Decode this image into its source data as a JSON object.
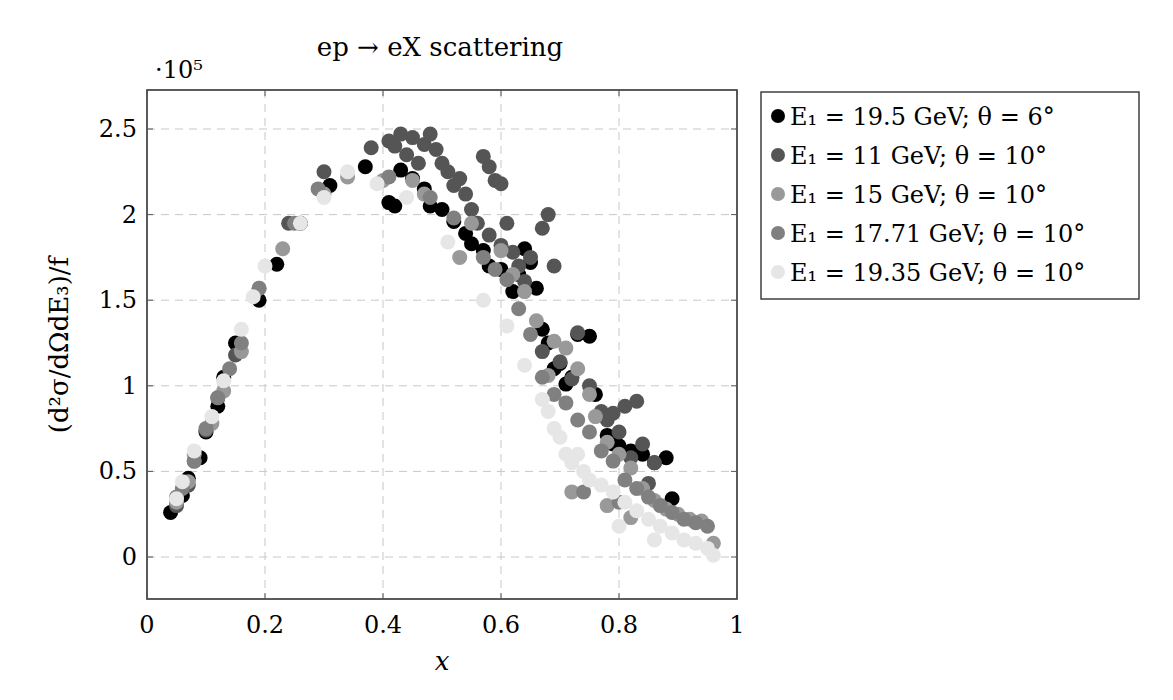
{
  "chart_data": {
    "type": "scatter",
    "title": "ep → eX scattering",
    "xlabel": "x",
    "ylabel": "(d²σ/dΩdE₃)/f",
    "y_scale_label": "·10⁵",
    "xlim": [
      0,
      1
    ],
    "ylim": [
      -0.25,
      2.72
    ],
    "x_ticks": [
      0,
      0.2,
      0.4,
      0.6,
      0.8,
      1
    ],
    "x_tick_labels": [
      "0",
      "0.2",
      "0.4",
      "0.6",
      "0.8",
      "1"
    ],
    "y_ticks": [
      0,
      0.5,
      1,
      1.5,
      2,
      2.5
    ],
    "y_tick_labels": [
      "0",
      "0.5",
      "1",
      "1.5",
      "2",
      "2.5"
    ],
    "grid": true,
    "legend_position": "outside right top",
    "series": [
      {
        "name": "E₁ = 19.5 GeV; θ = 6°",
        "color": "#000000",
        "points": [
          [
            0.04,
            0.26
          ],
          [
            0.06,
            0.36
          ],
          [
            0.07,
            0.46
          ],
          [
            0.09,
            0.58
          ],
          [
            0.1,
            0.73
          ],
          [
            0.12,
            0.88
          ],
          [
            0.13,
            1.05
          ],
          [
            0.15,
            1.25
          ],
          [
            0.19,
            1.5
          ],
          [
            0.22,
            1.71
          ],
          [
            0.26,
            1.95
          ],
          [
            0.31,
            2.17
          ],
          [
            0.37,
            2.28
          ],
          [
            0.41,
            2.07
          ],
          [
            0.42,
            2.05
          ],
          [
            0.43,
            2.26
          ],
          [
            0.45,
            2.21
          ],
          [
            0.47,
            2.15
          ],
          [
            0.48,
            2.05
          ],
          [
            0.5,
            2.03
          ],
          [
            0.52,
            1.96
          ],
          [
            0.54,
            1.89
          ],
          [
            0.55,
            1.83
          ],
          [
            0.57,
            1.79
          ],
          [
            0.58,
            1.7
          ],
          [
            0.6,
            1.68
          ],
          [
            0.62,
            1.55
          ],
          [
            0.63,
            1.65
          ],
          [
            0.64,
            1.8
          ],
          [
            0.65,
            1.72
          ],
          [
            0.66,
            1.57
          ],
          [
            0.67,
            1.33
          ],
          [
            0.68,
            1.25
          ],
          [
            0.69,
            1.1
          ],
          [
            0.7,
            1.13
          ],
          [
            0.71,
            1.01
          ],
          [
            0.72,
            1.05
          ],
          [
            0.73,
            1.3
          ],
          [
            0.75,
            1.29
          ],
          [
            0.76,
            0.95
          ],
          [
            0.78,
            0.71
          ],
          [
            0.79,
            0.66
          ],
          [
            0.8,
            0.65
          ],
          [
            0.82,
            0.62
          ],
          [
            0.84,
            0.6
          ],
          [
            0.86,
            0.55
          ],
          [
            0.88,
            0.58
          ],
          [
            0.89,
            0.34
          ]
        ]
      },
      {
        "name": "E₁ = 11 GeV; θ = 10°",
        "color": "#555555",
        "points": [
          [
            0.05,
            0.3
          ],
          [
            0.07,
            0.42
          ],
          [
            0.08,
            0.56
          ],
          [
            0.1,
            0.74
          ],
          [
            0.12,
            0.93
          ],
          [
            0.15,
            1.18
          ],
          [
            0.24,
            1.95
          ],
          [
            0.3,
            2.25
          ],
          [
            0.38,
            2.39
          ],
          [
            0.41,
            2.43
          ],
          [
            0.42,
            2.4
          ],
          [
            0.43,
            2.47
          ],
          [
            0.44,
            2.35
          ],
          [
            0.45,
            2.45
          ],
          [
            0.46,
            2.3
          ],
          [
            0.47,
            2.41
          ],
          [
            0.48,
            2.47
          ],
          [
            0.49,
            2.38
          ],
          [
            0.5,
            2.3
          ],
          [
            0.51,
            2.25
          ],
          [
            0.52,
            2.17
          ],
          [
            0.53,
            2.21
          ],
          [
            0.54,
            2.12
          ],
          [
            0.55,
            2.03
          ],
          [
            0.57,
            2.34
          ],
          [
            0.58,
            2.28
          ],
          [
            0.59,
            2.2
          ],
          [
            0.6,
            2.18
          ],
          [
            0.56,
            1.95
          ],
          [
            0.58,
            1.88
          ],
          [
            0.6,
            1.82
          ],
          [
            0.61,
            1.95
          ],
          [
            0.62,
            1.78
          ],
          [
            0.63,
            1.7
          ],
          [
            0.64,
            1.61
          ],
          [
            0.65,
            1.75
          ],
          [
            0.67,
            1.92
          ],
          [
            0.68,
            2.0
          ],
          [
            0.69,
            1.7
          ],
          [
            0.67,
            1.2
          ],
          [
            0.7,
            1.14
          ],
          [
            0.72,
            1.04
          ],
          [
            0.73,
            1.31
          ],
          [
            0.75,
            1.0
          ],
          [
            0.77,
            0.85
          ],
          [
            0.78,
            0.8
          ],
          [
            0.79,
            0.84
          ],
          [
            0.81,
            0.88
          ],
          [
            0.83,
            0.91
          ],
          [
            0.84,
            0.66
          ],
          [
            0.86,
            0.55
          ],
          [
            0.8,
            0.73
          ],
          [
            0.82,
            0.58
          ],
          [
            0.85,
            0.43
          ]
        ]
      },
      {
        "name": "E₁ = 15 GeV; θ = 10°",
        "color": "#999999",
        "points": [
          [
            0.05,
            0.32
          ],
          [
            0.07,
            0.44
          ],
          [
            0.08,
            0.6
          ],
          [
            0.11,
            0.78
          ],
          [
            0.13,
            0.97
          ],
          [
            0.16,
            1.2
          ],
          [
            0.19,
            1.57
          ],
          [
            0.23,
            1.8
          ],
          [
            0.3,
            2.12
          ],
          [
            0.34,
            2.22
          ],
          [
            0.4,
            2.2
          ],
          [
            0.45,
            2.2
          ],
          [
            0.47,
            2.12
          ],
          [
            0.53,
            1.75
          ],
          [
            0.55,
            1.95
          ],
          [
            0.6,
            1.79
          ],
          [
            0.62,
            1.65
          ],
          [
            0.64,
            1.55
          ],
          [
            0.66,
            1.38
          ],
          [
            0.68,
            1.06
          ],
          [
            0.69,
            1.26
          ],
          [
            0.71,
            1.22
          ],
          [
            0.73,
            1.1
          ],
          [
            0.75,
            0.95
          ],
          [
            0.76,
            0.82
          ],
          [
            0.78,
            0.67
          ],
          [
            0.8,
            0.6
          ],
          [
            0.82,
            0.52
          ],
          [
            0.84,
            0.4
          ],
          [
            0.86,
            0.33
          ],
          [
            0.88,
            0.28
          ],
          [
            0.9,
            0.25
          ],
          [
            0.92,
            0.22
          ],
          [
            0.94,
            0.21
          ],
          [
            0.96,
            0.08
          ],
          [
            0.72,
            0.38
          ],
          [
            0.78,
            0.3
          ],
          [
            0.82,
            0.23
          ]
        ]
      },
      {
        "name": "E₁ = 17.71 GeV; θ = 10°",
        "color": "#808080",
        "points": [
          [
            0.05,
            0.35
          ],
          [
            0.06,
            0.4
          ],
          [
            0.08,
            0.56
          ],
          [
            0.1,
            0.75
          ],
          [
            0.12,
            0.93
          ],
          [
            0.14,
            1.1
          ],
          [
            0.16,
            1.25
          ],
          [
            0.19,
            1.57
          ],
          [
            0.25,
            1.95
          ],
          [
            0.29,
            2.15
          ],
          [
            0.41,
            2.22
          ],
          [
            0.48,
            2.1
          ],
          [
            0.52,
            1.98
          ],
          [
            0.57,
            1.75
          ],
          [
            0.59,
            1.68
          ],
          [
            0.61,
            1.62
          ],
          [
            0.63,
            1.45
          ],
          [
            0.65,
            1.3
          ],
          [
            0.67,
            1.05
          ],
          [
            0.69,
            0.95
          ],
          [
            0.71,
            0.9
          ],
          [
            0.73,
            0.8
          ],
          [
            0.75,
            0.73
          ],
          [
            0.77,
            0.62
          ],
          [
            0.79,
            0.56
          ],
          [
            0.81,
            0.45
          ],
          [
            0.83,
            0.4
          ],
          [
            0.85,
            0.35
          ],
          [
            0.87,
            0.3
          ],
          [
            0.89,
            0.26
          ],
          [
            0.91,
            0.22
          ],
          [
            0.93,
            0.2
          ],
          [
            0.95,
            0.18
          ],
          [
            0.74,
            0.38
          ],
          [
            0.8,
            0.32
          ]
        ]
      },
      {
        "name": "E₁ = 19.35 GeV; θ = 10°",
        "color": "#e6e6e6",
        "points": [
          [
            0.05,
            0.34
          ],
          [
            0.06,
            0.44
          ],
          [
            0.08,
            0.62
          ],
          [
            0.11,
            0.82
          ],
          [
            0.13,
            1.03
          ],
          [
            0.16,
            1.33
          ],
          [
            0.18,
            1.52
          ],
          [
            0.2,
            1.7
          ],
          [
            0.26,
            1.95
          ],
          [
            0.3,
            2.1
          ],
          [
            0.34,
            2.25
          ],
          [
            0.39,
            2.18
          ],
          [
            0.44,
            2.1
          ],
          [
            0.51,
            1.84
          ],
          [
            0.57,
            1.5
          ],
          [
            0.61,
            1.35
          ],
          [
            0.64,
            1.12
          ],
          [
            0.67,
            0.92
          ],
          [
            0.68,
            0.85
          ],
          [
            0.69,
            0.75
          ],
          [
            0.7,
            0.7
          ],
          [
            0.71,
            0.6
          ],
          [
            0.72,
            0.55
          ],
          [
            0.73,
            0.6
          ],
          [
            0.74,
            0.5
          ],
          [
            0.75,
            0.45
          ],
          [
            0.77,
            0.42
          ],
          [
            0.79,
            0.38
          ],
          [
            0.81,
            0.32
          ],
          [
            0.83,
            0.27
          ],
          [
            0.85,
            0.22
          ],
          [
            0.87,
            0.18
          ],
          [
            0.89,
            0.14
          ],
          [
            0.91,
            0.1
          ],
          [
            0.93,
            0.08
          ],
          [
            0.95,
            0.05
          ],
          [
            0.96,
            0.01
          ],
          [
            0.8,
            0.18
          ],
          [
            0.86,
            0.1
          ]
        ]
      }
    ]
  }
}
